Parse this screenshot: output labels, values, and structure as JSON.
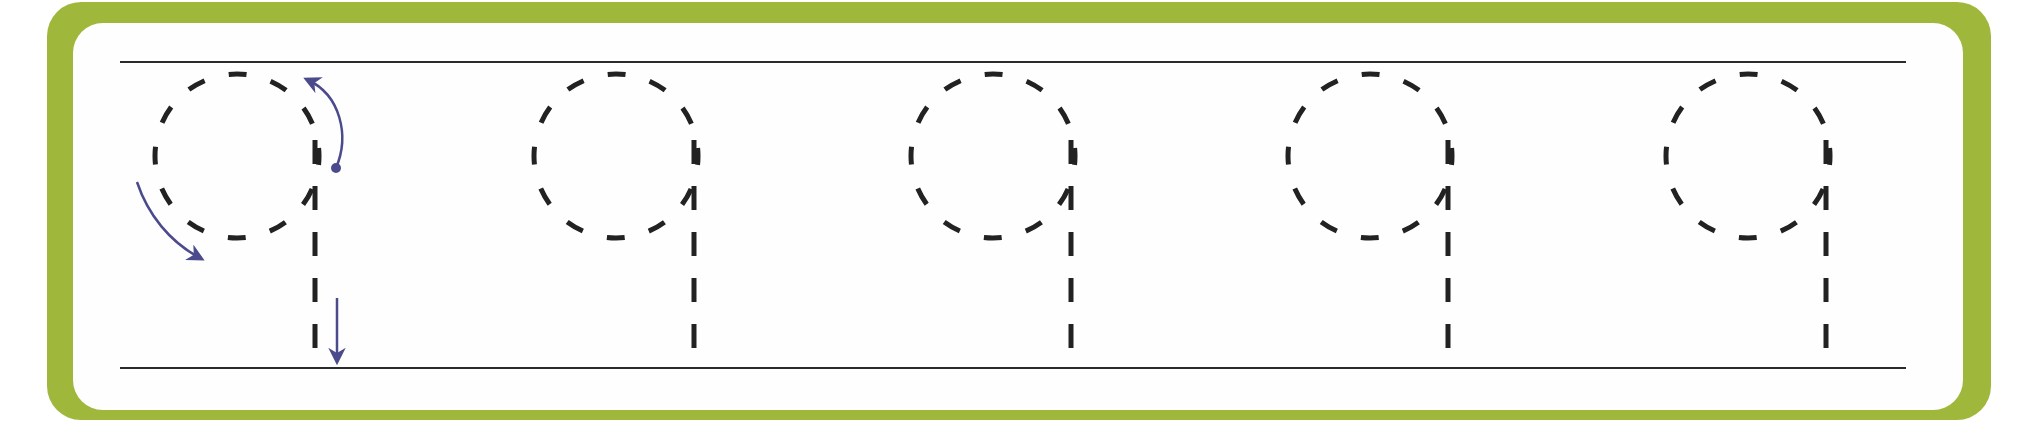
{
  "worksheet": {
    "type": "handwriting-tracing",
    "character": "9",
    "glyph_count": 5,
    "colors": {
      "frame": "#9fb83c",
      "sheet": "#fefefe",
      "guide_line": "#2b2b2b",
      "dash": "#222222",
      "arrow": "#4b4a8c"
    },
    "guide_lines": {
      "top": {
        "y": 62,
        "x1": 120,
        "x2": 1906
      },
      "bottom": {
        "y": 368,
        "x1": 120,
        "x2": 1906
      }
    },
    "glyph_geometry": {
      "radius": 82,
      "center_y": 156,
      "stem_offset_x": 78,
      "stem_top_y": 140,
      "stem_bottom_y": 368
    },
    "glyphs": [
      {
        "label": "9",
        "center_x": 237,
        "has_stroke_arrows": true
      },
      {
        "label": "9",
        "center_x": 616,
        "has_stroke_arrows": false
      },
      {
        "label": "9",
        "center_x": 993,
        "has_stroke_arrows": false
      },
      {
        "label": "9",
        "center_x": 1370,
        "has_stroke_arrows": false
      },
      {
        "label": "9",
        "center_x": 1748,
        "has_stroke_arrows": false
      }
    ],
    "stroke_arrows": [
      {
        "name": "start-curve-up-arrow",
        "description": "Start at dot, curve up and over counter-clockwise"
      },
      {
        "name": "curve-down-left-arrow",
        "description": "Continue around the circle down and back to the right"
      },
      {
        "name": "stem-down-arrow",
        "description": "Draw straight stem down to baseline"
      }
    ]
  }
}
